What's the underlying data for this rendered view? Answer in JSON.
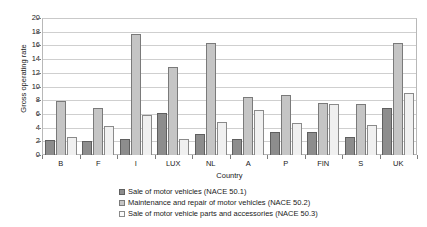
{
  "chart_data": {
    "type": "bar",
    "title": "",
    "xlabel": "Country",
    "ylabel": "Gross operating rate",
    "ylim": [
      0,
      20
    ],
    "yticks": [
      0,
      2,
      4,
      6,
      8,
      10,
      12,
      14,
      16,
      18,
      20
    ],
    "grid": true,
    "legend_position": "bottom",
    "categories": [
      "B",
      "F",
      "I",
      "LUX",
      "NL",
      "A",
      "P",
      "FIN",
      "S",
      "UK"
    ],
    "series": [
      {
        "name": "Sale of motor vehicles (NACE 50.1)",
        "color": "#8d8d8d",
        "values": [
          2.2,
          2.1,
          2.3,
          6.1,
          3.0,
          2.4,
          3.4,
          3.4,
          2.7,
          6.9
        ]
      },
      {
        "name": "Maintenance and repair of motor vehicles (NACE 50.2)",
        "color": "#c5c5c5",
        "values": [
          7.9,
          6.8,
          17.7,
          12.8,
          16.4,
          8.5,
          8.7,
          7.6,
          7.5,
          16.4
        ]
      },
      {
        "name": "Sale of motor vehicle parts and accessories (NACE 50.3)",
        "color": "#f0f0f0",
        "values": [
          2.6,
          4.2,
          5.8,
          2.3,
          4.8,
          6.5,
          4.7,
          7.5,
          4.4,
          9.0
        ]
      }
    ]
  }
}
